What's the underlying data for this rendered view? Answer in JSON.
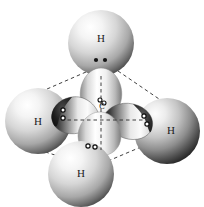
{
  "figure": {
    "background_color": "#ffffff",
    "width": 204,
    "height": 207
  },
  "central_atom": {
    "symbol": "C",
    "name": "carbon-atom",
    "cx": 101,
    "cy": 114,
    "label_x": 102,
    "label_y": 106
  },
  "hydrogen_atoms": [
    {
      "symbol": "H",
      "position": "top",
      "cx": 101,
      "cy": 43,
      "r": 33,
      "label_x": 101,
      "label_y": 38
    },
    {
      "symbol": "H",
      "position": "left",
      "cx": 38,
      "cy": 121,
      "r": 33,
      "label_x": 38,
      "label_y": 121
    },
    {
      "symbol": "H",
      "position": "right",
      "cx": 166,
      "cy": 130,
      "r": 33,
      "label_x": 170,
      "label_y": 130
    },
    {
      "symbol": "H",
      "position": "bottom",
      "cx": 81,
      "cy": 173,
      "r": 33,
      "label_x": 81,
      "label_y": 173
    }
  ],
  "orbital_lobes": [
    {
      "name": "sp3-lobe-top",
      "angle": 0,
      "tone": "light"
    },
    {
      "name": "sp3-lobe-left",
      "angle": 200,
      "tone": "dark"
    },
    {
      "name": "sp3-lobe-right",
      "angle": 20,
      "tone": "dark"
    },
    {
      "name": "sp3-lobe-bottom",
      "angle": 180,
      "tone": "light"
    }
  ],
  "electron_pairs": [
    {
      "name": "electron-pair-top",
      "style": "filled",
      "x1": 96,
      "y1": 60,
      "x2": 105,
      "y2": 60
    },
    {
      "name": "electron-pair-left",
      "style": "open",
      "x1": 63,
      "y1": 110,
      "x2": 63,
      "y2": 117
    },
    {
      "name": "electron-pair-right",
      "style": "open",
      "x1": 144,
      "y1": 117,
      "x2": 147,
      "y2": 124
    },
    {
      "name": "electron-pair-bottom",
      "style": "open",
      "x1": 88,
      "y1": 145,
      "x2": 95,
      "y2": 146
    },
    {
      "name": "electron-pair-center",
      "style": "open",
      "x1": 100,
      "y1": 99,
      "x2": 103,
      "y2": 102
    }
  ],
  "bond_edges": [
    {
      "name": "edge-top-left",
      "x1": 86,
      "y1": 72,
      "x2": 33,
      "y2": 95
    },
    {
      "name": "edge-top-right",
      "x1": 118,
      "y1": 72,
      "x2": 163,
      "y2": 101
    },
    {
      "name": "edge-left-bottom",
      "x1": 33,
      "y1": 148,
      "x2": 60,
      "y2": 155
    },
    {
      "name": "edge-bottom-right",
      "x1": 107,
      "y1": 160,
      "x2": 147,
      "y2": 144
    },
    {
      "name": "edge-top-center",
      "x1": 101,
      "y1": 72,
      "x2": 101,
      "y2": 114
    }
  ],
  "axes": [
    {
      "name": "axis-vertical",
      "x1": 101,
      "y1": 74,
      "x2": 101,
      "y2": 150
    },
    {
      "name": "axis-horizontal",
      "x1": 62,
      "y1": 120,
      "x2": 146,
      "y2": 120
    }
  ],
  "colors": {
    "sphere_highlight": "#ffffff",
    "sphere_midtone": "#c9c9c9",
    "sphere_shadow": "#3a3a3a",
    "lobe_dark": "#232323",
    "line": "#2b2b2b",
    "text": "#1b1b1b"
  }
}
